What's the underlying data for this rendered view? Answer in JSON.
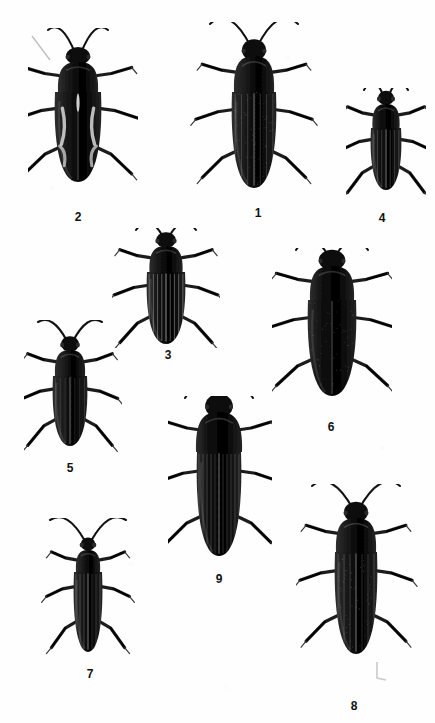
{
  "plate": {
    "kind": "scientific-figure-plate",
    "subject": "beetles",
    "view": "dorsal",
    "background_color": "#ffffff",
    "ink_color": "#111111",
    "width": 435,
    "height": 723
  },
  "figures": [
    {
      "id": "fig-2",
      "label": "2",
      "label_x": 78,
      "label_y": 211,
      "x": 28,
      "y": 28,
      "w": 110,
      "h": 180,
      "body_cx": 78,
      "body_top": 92,
      "body_w": 46,
      "body_h": 90,
      "pronotum_w": 40,
      "pronotum_h": 30,
      "elytra_pattern": "pale-maculate",
      "antenna_len": 62,
      "antenna_spread": 30,
      "tone": "#171717",
      "note": "broad oval elytra with light sinuous markings"
    },
    {
      "id": "fig-1",
      "label": "1",
      "label_x": 258,
      "label_y": 207,
      "x": 190,
      "y": 22,
      "w": 128,
      "h": 182,
      "body_cx": 254,
      "body_top": 92,
      "body_w": 44,
      "body_h": 96,
      "pronotum_w": 40,
      "pronotum_h": 36,
      "elytra_pattern": "fine-striate-pubescent",
      "antenna_len": 76,
      "antenna_spread": 44,
      "tone": "#1b1b1b",
      "note": "largest specimen, hairy rounded pronotum, long divergent antennae"
    },
    {
      "id": "fig-4",
      "label": "4",
      "label_x": 382,
      "label_y": 212,
      "x": 346,
      "y": 88,
      "w": 80,
      "h": 116,
      "body_cx": 386,
      "body_top": 128,
      "body_w": 30,
      "body_h": 62,
      "pronotum_w": 27,
      "pronotum_h": 24,
      "elytra_pattern": "striate",
      "antenna_len": 42,
      "antenna_spread": 22,
      "tone": "#121212",
      "note": "small compact beetle, short body"
    },
    {
      "id": "fig-3",
      "label": "3",
      "label_x": 168,
      "label_y": 349,
      "x": 112,
      "y": 228,
      "w": 108,
      "h": 120,
      "body_cx": 166,
      "body_top": 272,
      "body_w": 38,
      "body_h": 72,
      "pronotum_w": 33,
      "pronotum_h": 26,
      "elytra_pattern": "strong-striate",
      "antenna_len": 46,
      "antenna_spread": 30,
      "tone": "#151515",
      "note": "deeply grooved longitudinal striae on elytra"
    },
    {
      "id": "fig-6",
      "label": "6",
      "label_x": 331,
      "label_y": 421,
      "x": 272,
      "y": 248,
      "w": 120,
      "h": 172,
      "body_cx": 332,
      "body_top": 300,
      "body_w": 48,
      "body_h": 96,
      "pronotum_w": 44,
      "pronotum_h": 34,
      "elytra_pattern": "granulate",
      "antenna_len": 56,
      "antenna_spread": 36,
      "tone": "#101010",
      "note": "robust broad-bodied beetle, coarsely punctate surface"
    },
    {
      "id": "fig-5",
      "label": "5",
      "label_x": 70,
      "label_y": 462,
      "x": 24,
      "y": 320,
      "w": 98,
      "h": 136,
      "body_cx": 70,
      "body_top": 376,
      "body_w": 34,
      "body_h": 70,
      "pronotum_w": 30,
      "pronotum_h": 26,
      "elytra_pattern": "faint-striate",
      "antenna_len": 50,
      "antenna_spread": 32,
      "tone": "#1e1e1e",
      "note": "medium beetle, rounded pronotum, grey-toned elytra"
    },
    {
      "id": "fig-9",
      "label": "9",
      "label_x": 219,
      "label_y": 573,
      "x": 168,
      "y": 396,
      "w": 104,
      "h": 174,
      "body_cx": 219,
      "body_top": 452,
      "body_w": 44,
      "body_h": 104,
      "pronotum_w": 46,
      "pronotum_h": 40,
      "elytra_pattern": "fine-striate",
      "antenna_len": 52,
      "antenna_spread": 34,
      "tone": "#0e0e0e",
      "note": "very large rounded pronotum, elongate parallel-sided elytra"
    },
    {
      "id": "fig-7",
      "label": "7",
      "label_x": 90,
      "label_y": 668,
      "x": 34,
      "y": 518,
      "w": 108,
      "h": 142,
      "body_cx": 88,
      "body_top": 572,
      "body_w": 28,
      "body_h": 80,
      "pronotum_w": 24,
      "pronotum_h": 22,
      "elytra_pattern": "soft-striate",
      "antenna_len": 58,
      "antenna_spread": 38,
      "tone": "#1a1a1a",
      "note": "slender soft-bodied beetle, narrow pronotum"
    },
    {
      "id": "fig-8",
      "label": "8",
      "label_x": 354,
      "label_y": 700,
      "x": 296,
      "y": 484,
      "w": 124,
      "h": 196,
      "body_cx": 356,
      "body_top": 552,
      "body_w": 42,
      "body_h": 102,
      "pronotum_w": 40,
      "pronotum_h": 34,
      "elytra_pattern": "pubescent-striate",
      "antenna_len": 70,
      "antenna_spread": 44,
      "tone": "#191919",
      "note": "long arching antennae, broad trapezoid pronotum"
    }
  ]
}
